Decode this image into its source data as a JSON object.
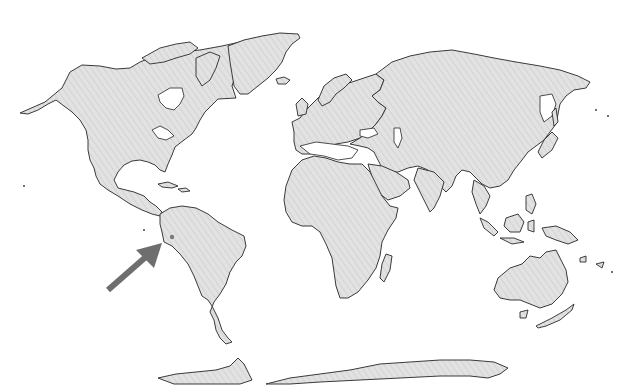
{
  "map": {
    "type": "world-map",
    "projection": "cylindrical (Miller-like)",
    "land_color": "#e2e2e2",
    "hatch_color": "#cfcfcf",
    "outline_color": "#3a3a3a",
    "background_color": "#ffffff",
    "marker": {
      "kind": "dot",
      "color": "#7a7a7a",
      "x": 172,
      "y": 237,
      "region": "Western South America (Ecuador / northern Peru)"
    },
    "arrow": {
      "color": "#6e6e6e",
      "from": [
        108,
        290
      ],
      "to": [
        160,
        245
      ],
      "points_to": "Western South America (Ecuador / northern Peru)"
    },
    "regions": [
      "North America",
      "Greenland",
      "South America",
      "Europe",
      "Africa",
      "Asia",
      "Australia",
      "New Zealand",
      "Antarctica",
      "Maritime Southeast Asia"
    ]
  }
}
